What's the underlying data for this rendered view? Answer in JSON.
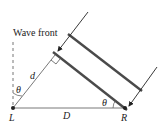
{
  "diagram": {
    "labels": {
      "wave_front": "Wave front",
      "d": "d",
      "theta_left": "θ",
      "theta_right": "θ",
      "D": "D",
      "L": "L",
      "R": "R"
    },
    "colors": {
      "line": "#333333",
      "wavefront_bar": "#4a4a4a",
      "dashed": "#777777"
    }
  }
}
